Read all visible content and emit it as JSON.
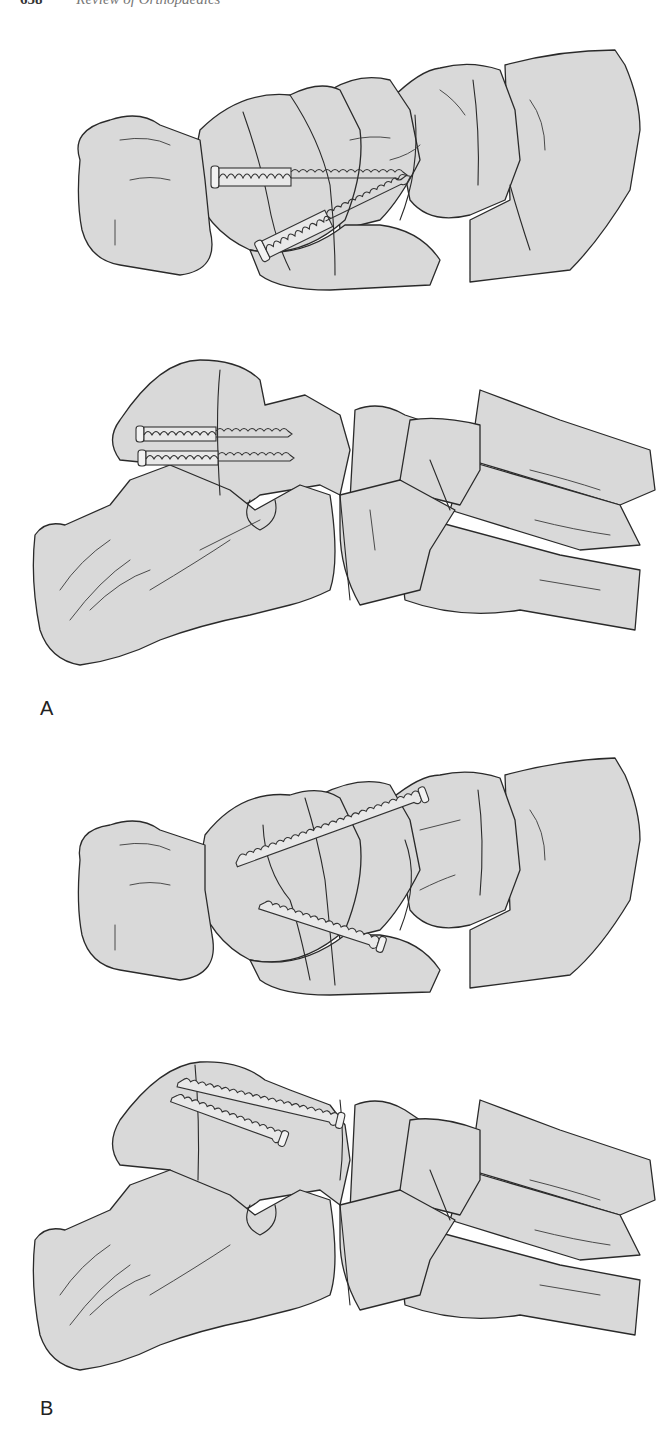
{
  "page": {
    "running_head": {
      "page_number": "658",
      "title": "Review of Orthopaedics"
    }
  },
  "figure": {
    "panels": [
      {
        "label": "A",
        "views": [
          {
            "name": "dorsal-view",
            "description": "Dorsal view of foot, talonavicular region, two partially threaded cancellous screws (washer-like heads) across navicular"
          },
          {
            "name": "lateral-view",
            "description": "Lateral view of foot, two parallel partially threaded screws placed from calcaneus/talus region"
          }
        ]
      },
      {
        "label": "B",
        "views": [
          {
            "name": "dorsal-view",
            "description": "Dorsal view of foot with two fully threaded screws crossing navicular obliquely"
          },
          {
            "name": "lateral-view",
            "description": "Lateral view of foot with two fully threaded screws placed retrograde"
          }
        ]
      }
    ]
  },
  "colors": {
    "bone_fill": "#d9d9d9",
    "outline": "#2a2a2a",
    "background": "#ffffff"
  }
}
